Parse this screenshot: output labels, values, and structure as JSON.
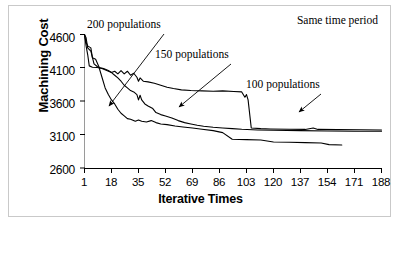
{
  "chart_data": {
    "type": "line",
    "title": "",
    "xlabel": "Iterative Times",
    "ylabel": "Machining Cost",
    "xlim": [
      1,
      188
    ],
    "ylim": [
      2600,
      4600
    ],
    "grid": false,
    "legend_position": "inline-annotations",
    "xticks": [
      1,
      18,
      35,
      52,
      69,
      86,
      103,
      120,
      137,
      154,
      171,
      188
    ],
    "yticks": [
      2600,
      3100,
      3600,
      4100,
      4600
    ],
    "annotations": [
      {
        "id": "same-time-period",
        "text": "Same time period"
      },
      {
        "id": "ann-200",
        "text": "200 populations"
      },
      {
        "id": "ann-150",
        "text": "150 populations"
      },
      {
        "id": "ann-100",
        "text": "100 populations"
      }
    ],
    "series": [
      {
        "name": "200 populations",
        "color": "#000000",
        "points": [
          [
            1,
            4600
          ],
          [
            2,
            4480
          ],
          [
            3,
            4430
          ],
          [
            5,
            4400
          ],
          [
            6,
            4250
          ],
          [
            8,
            4230
          ],
          [
            10,
            4120
          ],
          [
            12,
            3960
          ],
          [
            14,
            3800
          ],
          [
            16,
            3700
          ],
          [
            18,
            3620
          ],
          [
            20,
            3560
          ],
          [
            22,
            3480
          ],
          [
            24,
            3420
          ],
          [
            26,
            3380
          ],
          [
            28,
            3340
          ],
          [
            30,
            3330
          ],
          [
            33,
            3300
          ],
          [
            35,
            3320
          ],
          [
            37,
            3300
          ],
          [
            40,
            3290
          ],
          [
            43,
            3310
          ],
          [
            46,
            3280
          ],
          [
            49,
            3260
          ],
          [
            53,
            3250
          ],
          [
            58,
            3230
          ],
          [
            63,
            3215
          ],
          [
            69,
            3200
          ],
          [
            75,
            3180
          ],
          [
            82,
            3160
          ],
          [
            88,
            3130
          ],
          [
            94,
            3030
          ],
          [
            103,
            3025
          ],
          [
            112,
            3020
          ],
          [
            120,
            2990
          ],
          [
            130,
            2985
          ],
          [
            140,
            2980
          ],
          [
            150,
            2975
          ],
          [
            155,
            2950
          ],
          [
            163,
            2945
          ]
        ]
      },
      {
        "name": "150 populations",
        "color": "#000000",
        "points": [
          [
            1,
            4600
          ],
          [
            2,
            4550
          ],
          [
            3,
            4400
          ],
          [
            5,
            4350
          ],
          [
            7,
            4160
          ],
          [
            9,
            4120
          ],
          [
            11,
            4100
          ],
          [
            13,
            4090
          ],
          [
            16,
            4060
          ],
          [
            18,
            4030
          ],
          [
            20,
            3990
          ],
          [
            22,
            3950
          ],
          [
            24,
            3900
          ],
          [
            26,
            3840
          ],
          [
            28,
            3800
          ],
          [
            30,
            3760
          ],
          [
            32,
            3740
          ],
          [
            34,
            3700
          ],
          [
            35,
            3620
          ],
          [
            36,
            3690
          ],
          [
            37,
            3620
          ],
          [
            39,
            3560
          ],
          [
            41,
            3530
          ],
          [
            44,
            3490
          ],
          [
            46,
            3430
          ],
          [
            49,
            3400
          ],
          [
            52,
            3380
          ],
          [
            56,
            3350
          ],
          [
            60,
            3310
          ],
          [
            64,
            3280
          ],
          [
            68,
            3260
          ],
          [
            72,
            3240
          ],
          [
            76,
            3225
          ],
          [
            82,
            3210
          ],
          [
            88,
            3200
          ],
          [
            94,
            3190
          ],
          [
            100,
            3180
          ],
          [
            110,
            3170
          ],
          [
            120,
            3165
          ],
          [
            137,
            3160
          ],
          [
            154,
            3155
          ],
          [
            171,
            3150
          ],
          [
            188,
            3150
          ]
        ]
      },
      {
        "name": "100 populations",
        "color": "#000000",
        "points": [
          [
            1,
            4600
          ],
          [
            2,
            4430
          ],
          [
            3,
            4300
          ],
          [
            4,
            4130
          ],
          [
            6,
            4110
          ],
          [
            9,
            4105
          ],
          [
            12,
            4090
          ],
          [
            15,
            4060
          ],
          [
            18,
            4030
          ],
          [
            20,
            4050
          ],
          [
            22,
            4010
          ],
          [
            24,
            4060
          ],
          [
            26,
            4010
          ],
          [
            28,
            4050
          ],
          [
            30,
            3990
          ],
          [
            32,
            4020
          ],
          [
            34,
            3960
          ],
          [
            35,
            3900
          ],
          [
            36,
            3950
          ],
          [
            38,
            3900
          ],
          [
            41,
            3890
          ],
          [
            45,
            3870
          ],
          [
            49,
            3840
          ],
          [
            53,
            3810
          ],
          [
            57,
            3790
          ],
          [
            62,
            3770
          ],
          [
            68,
            3760
          ],
          [
            75,
            3755
          ],
          [
            82,
            3750
          ],
          [
            88,
            3755
          ],
          [
            95,
            3745
          ],
          [
            100,
            3740
          ],
          [
            102,
            3660
          ],
          [
            103,
            3700
          ],
          [
            104,
            3620
          ],
          [
            106,
            3200
          ],
          [
            112,
            3190
          ],
          [
            118,
            3185
          ],
          [
            130,
            3180
          ],
          [
            140,
            3178
          ],
          [
            145,
            3200
          ],
          [
            148,
            3178
          ],
          [
            160,
            3175
          ],
          [
            175,
            3172
          ],
          [
            188,
            3170
          ]
        ]
      }
    ]
  },
  "arrows": [
    {
      "id": "arrow-200",
      "from": [
        155,
        28
      ],
      "to": [
        100,
        100
      ]
    },
    {
      "id": "arrow-150",
      "from": [
        222,
        58
      ],
      "to": [
        170,
        101
      ]
    },
    {
      "id": "arrow-100",
      "from": [
        312,
        88
      ],
      "to": [
        290,
        106
      ]
    }
  ]
}
